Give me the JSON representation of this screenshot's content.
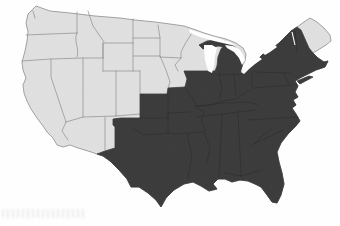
{
  "page": {
    "background": "#ffffff",
    "width_px": 340,
    "height_px": 226
  },
  "map": {
    "type": "us-states-choropleth",
    "colors": {
      "highlighted_fill": "#3b3b3b",
      "base_fill": "#e0e0e0",
      "state_border": "#8d8d8d",
      "highlighted_state_border": "#262626",
      "water": "#ffffff"
    },
    "highlighted_states": [
      "Texas",
      "Oklahoma",
      "Kansas",
      "Missouri",
      "Arkansas",
      "Louisiana",
      "Mississippi",
      "Alabama",
      "Georgia",
      "Florida",
      "Tennessee",
      "Kentucky",
      "Illinois",
      "Indiana",
      "Ohio",
      "Michigan",
      "West Virginia",
      "Virginia",
      "North Carolina",
      "South Carolina",
      "Pennsylvania",
      "New York",
      "New Jersey",
      "Delaware",
      "Maryland",
      "Connecticut",
      "Rhode Island",
      "Massachusetts",
      "Vermont",
      "New Hampshire"
    ],
    "unhighlighted_states": [
      "Washington",
      "Oregon",
      "California",
      "Idaho",
      "Nevada",
      "Arizona",
      "Utah",
      "Montana",
      "Wyoming",
      "Colorado",
      "New Mexico",
      "North Dakota",
      "South Dakota",
      "Nebraska",
      "Minnesota",
      "Iowa",
      "Wisconsin",
      "Maine"
    ],
    "lakes": [
      "Lake Superior",
      "Lake Michigan",
      "Lake Huron",
      "Lake Erie",
      "Lake Ontario"
    ],
    "watermark": {
      "present": true,
      "legible": false
    }
  }
}
